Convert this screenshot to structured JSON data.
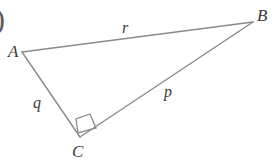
{
  "figure": {
    "kind": "geometry-diagram",
    "shape": "right-triangle",
    "background_color": "#ffffff",
    "stroke_color": "#8a8a8a",
    "label_color": "#3a3a3a",
    "stray_marker": ")"
  },
  "vertices": {
    "a": {
      "label": "A",
      "x": 22,
      "y": 52,
      "label_x": 8,
      "label_y": 43
    },
    "b": {
      "label": "B",
      "x": 253,
      "y": 22,
      "label_x": 257,
      "label_y": 7
    },
    "c": {
      "label": "C",
      "x": 80,
      "y": 137,
      "label_x": 72,
      "label_y": 143
    }
  },
  "sides": {
    "r": {
      "label": "r",
      "from": "A",
      "to": "B",
      "label_x": 122,
      "label_y": 20
    },
    "p": {
      "label": "p",
      "from": "C",
      "to": "B",
      "label_x": 164,
      "label_y": 84
    },
    "q": {
      "label": "q",
      "from": "A",
      "to": "C",
      "label_x": 33,
      "label_y": 95
    }
  },
  "right_angle": {
    "at_vertex": "C",
    "marker": "square",
    "points": "78,133 76,119 90,114 96,128"
  },
  "chart_data": {
    "type": "diagram",
    "title": "",
    "points": [
      {
        "name": "A",
        "x": 22,
        "y": 52
      },
      {
        "name": "B",
        "x": 253,
        "y": 22
      },
      {
        "name": "C",
        "x": 80,
        "y": 137
      }
    ],
    "edges": [
      {
        "name": "r",
        "from": "A",
        "to": "B"
      },
      {
        "name": "p",
        "from": "C",
        "to": "B"
      },
      {
        "name": "q",
        "from": "A",
        "to": "C"
      }
    ],
    "annotations": [
      "right angle at C"
    ]
  }
}
